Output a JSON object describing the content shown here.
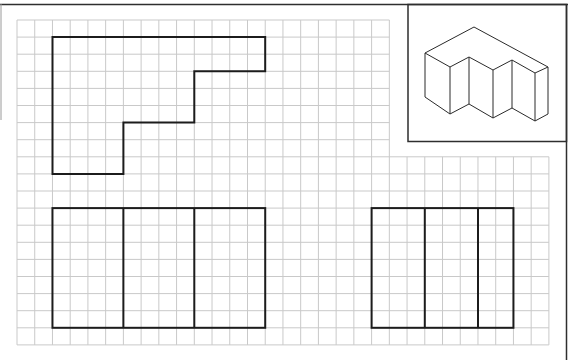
{
  "diagram": {
    "grid": {
      "origin_x": 17,
      "origin_y": 20,
      "cell_w": 17.73,
      "cell_h": 17.1,
      "columns": 30,
      "rows": 19,
      "blank_region": {
        "col_from": 21,
        "col_to": 30,
        "row_from": 0,
        "row_to": 8
      },
      "line_color": "#c9c9c9"
    },
    "views": [
      {
        "name": "top-view",
        "outline_cells": [
          [
            2,
            1
          ],
          [
            14,
            1
          ],
          [
            14,
            3
          ],
          [
            10,
            3
          ],
          [
            10,
            6
          ],
          [
            6,
            6
          ],
          [
            6,
            9
          ],
          [
            2,
            9
          ]
        ]
      },
      {
        "name": "front-view",
        "rect_cells": {
          "col_from": 2,
          "col_to": 14,
          "row_from": 11,
          "row_to": 18
        },
        "dividers_cols": [
          6,
          10
        ]
      },
      {
        "name": "side-view",
        "rect_cells": {
          "col_from": 20,
          "col_to": 28,
          "row_from": 11,
          "row_to": 18
        },
        "dividers_cols": [
          23,
          26
        ]
      }
    ],
    "isometric_inset": {
      "box": {
        "x": 408,
        "y": 4,
        "w": 158,
        "h": 138
      },
      "line_color": "#2a2a2a"
    },
    "stroke_color": "#1c1c1c"
  }
}
